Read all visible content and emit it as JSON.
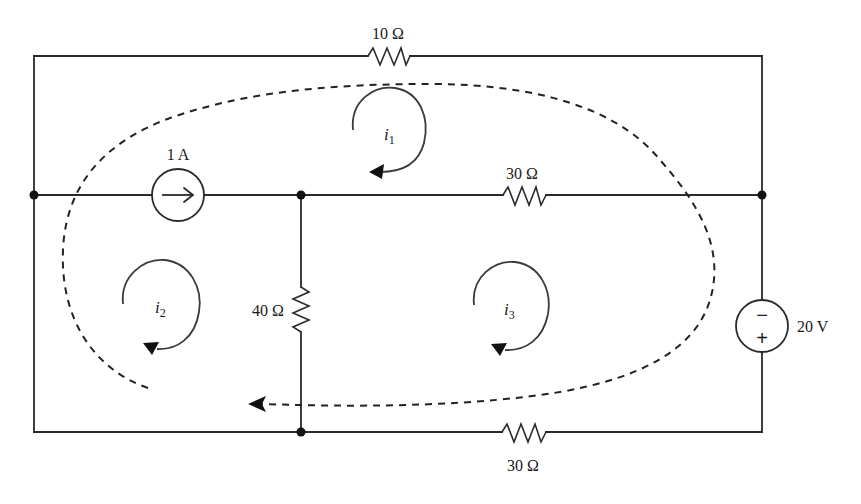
{
  "diagram": {
    "type": "circuit",
    "components": {
      "r_top": {
        "label": "10 Ω",
        "value_ohms": 10,
        "position": "top branch"
      },
      "r_middle": {
        "label": "30 Ω",
        "value_ohms": 30,
        "position": "middle branch, right"
      },
      "r_vertical": {
        "label": "40 Ω",
        "value_ohms": 40,
        "position": "vertical branch, center"
      },
      "r_bottom": {
        "label": "30 Ω",
        "value_ohms": 30,
        "position": "bottom branch, right"
      },
      "current_source": {
        "label": "1 A",
        "value_amps": 1,
        "direction": "left-to-right"
      },
      "voltage_source": {
        "label": "20 V",
        "value_volts": 20,
        "top_sign": "−",
        "bottom_sign": "+"
      }
    },
    "mesh_currents": [
      {
        "name": "i",
        "sub": "1",
        "direction": "clockwise",
        "loop": "top"
      },
      {
        "name": "i",
        "sub": "2",
        "direction": "clockwise",
        "loop": "bottom-left"
      },
      {
        "name": "i",
        "sub": "3",
        "direction": "clockwise",
        "loop": "bottom-right"
      }
    ],
    "supermesh": {
      "style": "dashed",
      "direction": "clockwise",
      "arrow_at": "bottom-left"
    },
    "colors": {
      "ink": "#2a2a2a",
      "background": "#ffffff"
    }
  }
}
